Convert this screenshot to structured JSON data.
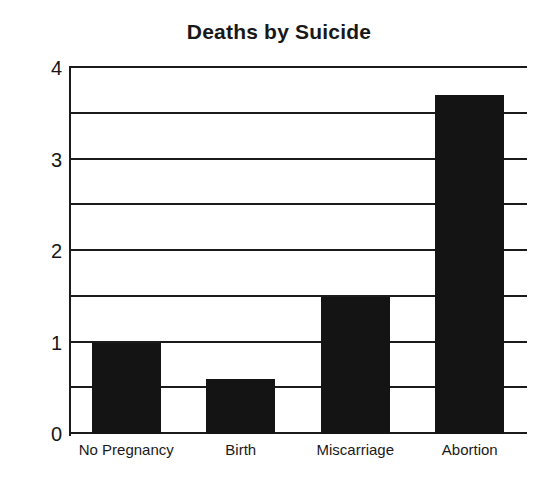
{
  "chart_data": {
    "type": "bar",
    "title": "Deaths by Suicide",
    "xlabel": "",
    "ylabel": "",
    "categories": [
      "No Pregnancy",
      "Birth",
      "Miscarriage",
      "Abortion"
    ],
    "values": [
      1.0,
      0.6,
      1.5,
      3.7
    ],
    "ylim": [
      0,
      4
    ],
    "ytick_labels": [
      "0",
      "1",
      "2",
      "3",
      "4"
    ],
    "ytick_values": [
      0,
      1,
      2,
      3,
      4
    ],
    "gridline_values": [
      0,
      0.5,
      1,
      1.5,
      2,
      2.5,
      3,
      3.5,
      4
    ],
    "grid": true,
    "legend": false,
    "bar_color": "#141414",
    "axis_color": "#1b1b1b",
    "background_color": "#ffffff"
  }
}
